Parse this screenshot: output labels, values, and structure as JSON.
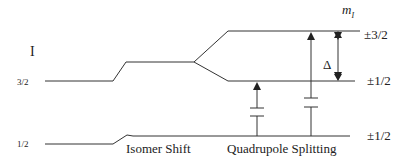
{
  "diagram": {
    "type": "energy-level-diagram",
    "spin_label": "I",
    "levels": [
      {
        "id": "excited",
        "spin": "3/2"
      },
      {
        "id": "ground",
        "spin": "1/2"
      }
    ],
    "mi_header": "m",
    "mi_header_subscript": "I",
    "sublevels": {
      "excited_upper": "±3/2",
      "excited_lower": "±1/2",
      "ground": "±1/2"
    },
    "splitting_symbol": "Δ",
    "captions": {
      "isomer_shift": "Isomer Shift",
      "quadrupole_splitting": "Quadrupole Splitting"
    },
    "colors": {
      "line": "#333333",
      "text": "#222222",
      "background": "#ffffff"
    }
  }
}
